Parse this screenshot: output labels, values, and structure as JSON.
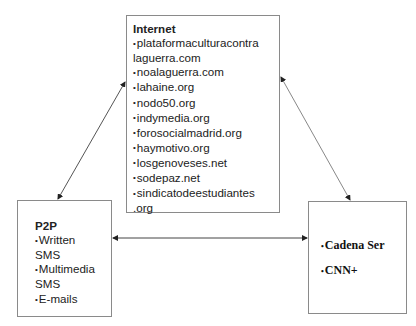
{
  "diagram": {
    "nodes": {
      "internet": {
        "title": "Internet",
        "items": [
          "plataformaculturacontra",
          "laguerra.com",
          "noalaguerra.com",
          "lahaine.org",
          "nodo50.org",
          "indymedia.org",
          "forosocialmadrid.org",
          "haymotivo.org",
          "losgenoveses.net",
          "sodepaz.net",
          "sindicatodeestudiantes",
          ".org"
        ]
      },
      "p2p": {
        "title": "P2P",
        "items": [
          "Written",
          "SMS",
          "Multimedia",
          "SMS",
          "E-mails"
        ]
      },
      "media": {
        "items": [
          "Cadena Ser",
          "CNN+"
        ]
      }
    },
    "bullet": "•",
    "edges": [
      {
        "from": "internet",
        "to": "p2p",
        "bidirectional": true
      },
      {
        "from": "internet",
        "to": "media",
        "bidirectional": true
      },
      {
        "from": "p2p",
        "to": "media",
        "bidirectional": true
      }
    ]
  }
}
